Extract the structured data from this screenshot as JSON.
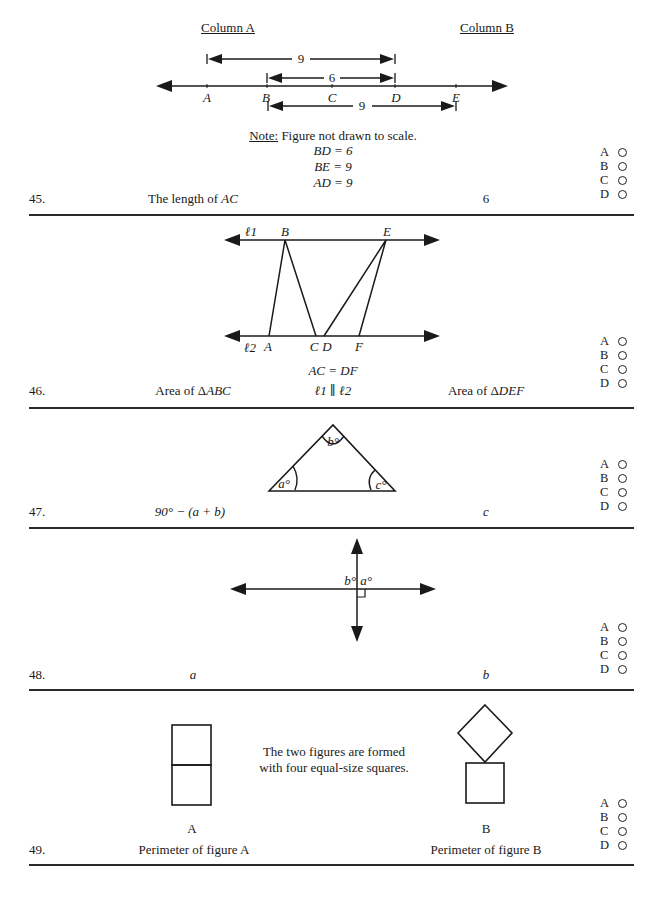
{
  "header": {
    "column_a": "Column A",
    "column_b": "Column B"
  },
  "answer_choices": [
    "A",
    "B",
    "C",
    "D"
  ],
  "questions": [
    {
      "number": "45.",
      "figure": {
        "points": [
          "A",
          "B",
          "C",
          "D",
          "E"
        ],
        "dimensions": [
          {
            "from": "A",
            "to": "D",
            "label": "9"
          },
          {
            "from": "B",
            "to": "D",
            "label": "6"
          },
          {
            "from": "B",
            "to": "E",
            "label": "9"
          }
        ]
      },
      "note_label": "Note:",
      "note_text": " Figure not drawn to scale.",
      "givens": [
        "BD = 6",
        "BE = 9",
        "AD = 9"
      ],
      "column_a": "The length of AC",
      "column_a_prefix": "The length of ",
      "column_a_var": "AC",
      "column_b": "6"
    },
    {
      "number": "46.",
      "figure": {
        "line_labels": [
          "ℓ1",
          "ℓ2"
        ],
        "top_points": [
          "B",
          "E"
        ],
        "bottom_points": [
          "A",
          "C",
          "D",
          "F"
        ]
      },
      "given": "AC = DF",
      "parallel_statement": "ℓ1 ∥ ℓ2",
      "column_a_prefix": "Area of Δ",
      "column_a_var": "ABC",
      "column_b_prefix": "Area of Δ",
      "column_b_var": "DEF"
    },
    {
      "number": "47.",
      "figure": {
        "angles": [
          "a°",
          "b°",
          "c°"
        ]
      },
      "column_a": "90° − (a + b)",
      "column_b": "c"
    },
    {
      "number": "48.",
      "figure": {
        "angles": [
          "b°",
          "a°"
        ]
      },
      "column_a": "a",
      "column_b": "b"
    },
    {
      "number": "49.",
      "description_line1": "The two figures are formed",
      "description_line2": "with four equal-size squares.",
      "figure_a_label": "A",
      "figure_b_label": "B",
      "column_a": "Perimeter of figure A",
      "column_b": "Perimeter of figure B"
    }
  ]
}
